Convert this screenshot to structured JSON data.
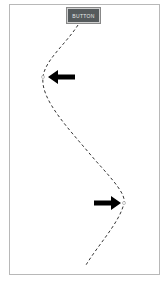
{
  "button": {
    "label": "BUTTON"
  },
  "path": {
    "style": "dashed",
    "color": "#333333",
    "points": [
      [
        78,
        25
      ],
      [
        43,
        77
      ],
      [
        124,
        203
      ],
      [
        86,
        265
      ]
    ]
  },
  "arrows": [
    {
      "direction": "left",
      "color": "#000000"
    },
    {
      "direction": "right",
      "color": "#000000"
    }
  ]
}
